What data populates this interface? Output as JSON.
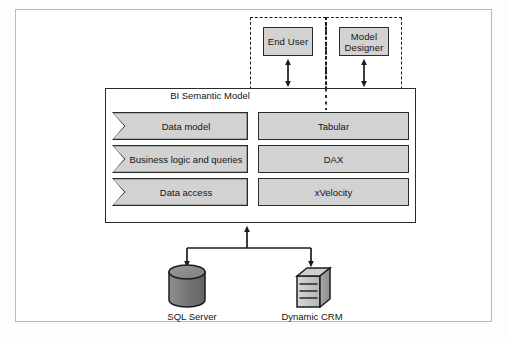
{
  "diagram": {
    "colors": {
      "node_fill": "#d2d2d2",
      "node_stroke": "#2b2b2b",
      "frame_stroke": "#b9b9b9",
      "dash_stroke": "#1c1c1c",
      "background": "#ffffff"
    }
  },
  "actors": [
    {
      "label": "End User",
      "icon": "person-box-icon"
    },
    {
      "label": "Model Designer",
      "icon": "person-box-icon"
    }
  ],
  "container": {
    "label": "BI Semantic Model"
  },
  "layers": [
    {
      "capability": "Data model",
      "technology": "Tabular"
    },
    {
      "capability": "Business logic and queries",
      "technology": "DAX"
    },
    {
      "capability": "Data access",
      "technology": "xVelocity"
    }
  ],
  "data_sources": [
    {
      "label": "SQL Server",
      "icon": "database-cylinder-icon"
    },
    {
      "label": "Dynamic CRM",
      "icon": "server-box-icon"
    }
  ],
  "connectors": [
    {
      "name": "end-user-to-model",
      "type": "double-arrow"
    },
    {
      "name": "model-designer-to-model",
      "type": "double-arrow"
    },
    {
      "name": "model-to-sources",
      "type": "branching-arrow"
    }
  ]
}
